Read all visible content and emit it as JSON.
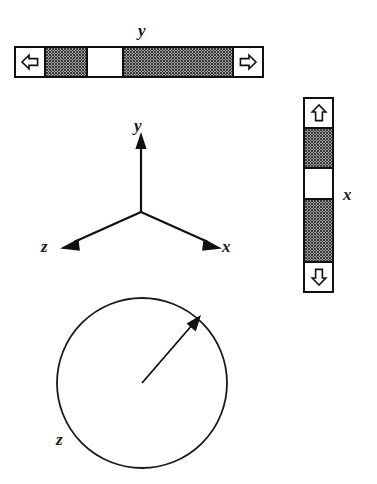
{
  "figure": {
    "background_color": "#ffffff",
    "stroke_color": "#111111",
    "fill_color": "#ffffff",
    "halftone_color": "#3a3a3a"
  },
  "scrollbar_y": {
    "name": "horizontal-scrollbar",
    "label": "y",
    "orientation": "horizontal",
    "decrement_icon": "arrow-left-icon",
    "increment_icon": "arrow-right-icon",
    "thumb_label": "",
    "track_before_fraction": 0.21,
    "thumb_fraction": 0.2,
    "track_after_fraction": 0.59
  },
  "scrollbar_x": {
    "name": "vertical-scrollbar",
    "label": "x",
    "orientation": "vertical",
    "decrement_icon": "arrow-up-icon",
    "increment_icon": "arrow-down-icon",
    "thumb_label": "",
    "track_before_fraction": 0.28,
    "thumb_fraction": 0.24,
    "track_after_fraction": 0.48
  },
  "axis_triad": {
    "name": "axis-triad",
    "origin_label": "",
    "axes": [
      {
        "id": "y",
        "label": "y",
        "direction": "up",
        "arrow_icon": "arrow-up-icon"
      },
      {
        "id": "z",
        "label": "z",
        "direction": "down-left",
        "arrow_icon": "arrow-down-left-icon"
      },
      {
        "id": "x",
        "label": "x",
        "direction": "down-right",
        "arrow_icon": "arrow-down-right-icon"
      }
    ]
  },
  "dial_z": {
    "name": "rotation-dial",
    "label": "z",
    "pointer_icon": "arrow-pointer-icon",
    "pointer_angle_deg": 55,
    "value": ""
  }
}
